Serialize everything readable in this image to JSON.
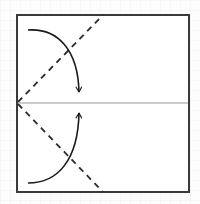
{
  "diagram": {
    "title": "Fold corners to center line",
    "canvas": {
      "width": 200,
      "height": 204
    },
    "square": {
      "x": 17,
      "y": 15,
      "width": 172,
      "height": 177,
      "stroke": "#3a3a3a",
      "stroke_width": 2
    },
    "center_line": {
      "x1": 17,
      "y1": 103,
      "x2": 189,
      "y2": 103,
      "stroke": "#999999",
      "stroke_width": 1
    },
    "fold_lines": [
      {
        "id": "upper-valley-fold",
        "x1": 17,
        "y1": 103,
        "x2": 103,
        "y2": 15,
        "style": "dashed",
        "stroke": "#2a2a2a"
      },
      {
        "id": "lower-valley-fold",
        "x1": 17,
        "y1": 103,
        "x2": 103,
        "y2": 192,
        "style": "dashed",
        "stroke": "#2a2a2a"
      }
    ],
    "arrows": [
      {
        "id": "upper-fold-arrow",
        "direction": "down",
        "from": [
          28,
          30
        ],
        "to": [
          79,
          93
        ],
        "stroke": "#1a1a1a"
      },
      {
        "id": "lower-fold-arrow",
        "direction": "up",
        "from": [
          28,
          183
        ],
        "to": [
          79,
          112
        ],
        "stroke": "#1a1a1a"
      }
    ]
  }
}
